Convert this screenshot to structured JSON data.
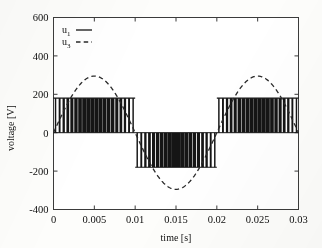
{
  "chart_data": {
    "type": "line",
    "title": "",
    "xlabel": "time [s]",
    "ylabel": "voltage [V]",
    "xlim": [
      0,
      0.03
    ],
    "ylim": [
      -400,
      600
    ],
    "xticks": [
      "0",
      "0.005",
      "0.01",
      "0.015",
      "0.02",
      "0.025",
      "0.03"
    ],
    "xtick_values": [
      0,
      0.005,
      0.01,
      0.015,
      0.02,
      0.025,
      0.03
    ],
    "yticks": [
      "600",
      "400",
      "200",
      "0",
      "-200",
      "-400"
    ],
    "ytick_values": [
      600,
      400,
      200,
      0,
      -200,
      -400
    ],
    "grid": false,
    "legend_position": "top-left",
    "series": [
      {
        "name": "u1",
        "label": "u",
        "subscript": "1",
        "style": "solid",
        "color": "#151515",
        "description": "PWM switched inverter output voltage, bipolar square pulses",
        "amplitude": 180,
        "switching_frequency_hz": 2000,
        "fundamental_frequency_hz": 50,
        "envelope": [
          {
            "t_start": 0.0,
            "t_end": 0.01,
            "level": 180
          },
          {
            "t_start": 0.01,
            "t_end": 0.02,
            "level": -180
          },
          {
            "t_start": 0.02,
            "t_end": 0.03,
            "level": 180
          }
        ]
      },
      {
        "name": "u3",
        "label": "u",
        "subscript": "3",
        "style": "dashed",
        "color": "#2a2a2a",
        "description": "Filtered sinusoidal voltage, 50 Hz",
        "amplitude": 295,
        "frequency_hz": 50,
        "phase_deg": 0,
        "samples_t": [
          0,
          0.0025,
          0.005,
          0.0075,
          0.01,
          0.0125,
          0.015,
          0.0175,
          0.02,
          0.0225,
          0.025,
          0.0275,
          0.03
        ],
        "samples_v": [
          0,
          209,
          295,
          209,
          0,
          -209,
          -295,
          -209,
          0,
          209,
          295,
          209,
          0
        ]
      }
    ]
  },
  "legend": {
    "entries": [
      {
        "symbol": "u",
        "sub": "1",
        "dash": "solid"
      },
      {
        "symbol": "u",
        "sub": "3",
        "dash": "dashed"
      }
    ]
  }
}
